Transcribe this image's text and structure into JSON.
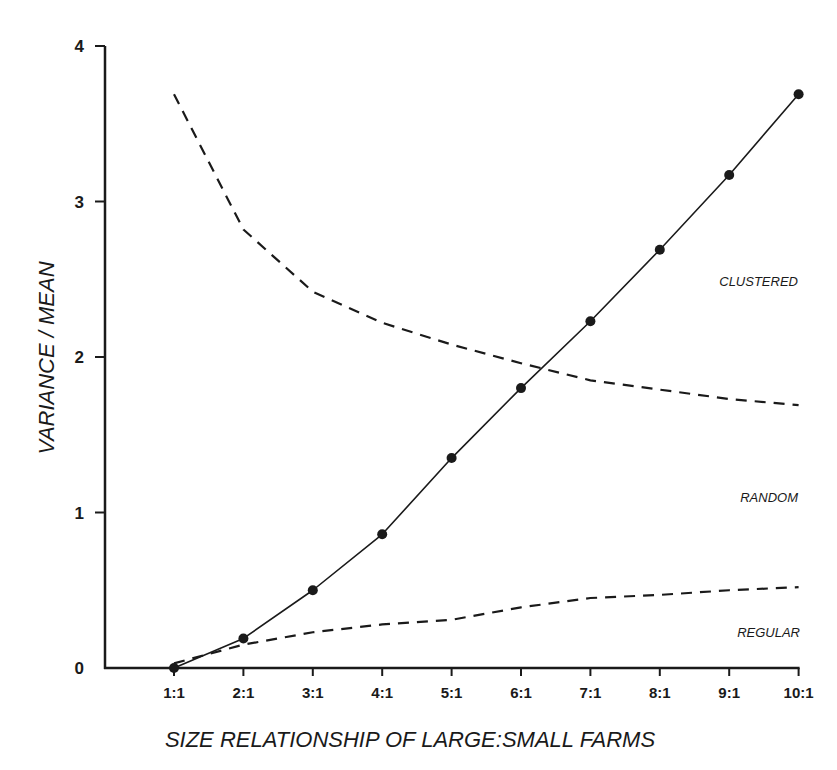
{
  "chart_data": {
    "type": "line",
    "title": "",
    "xlabel": "SIZE RELATIONSHIP OF LARGE:SMALL FARMS",
    "ylabel": "VARIANCE / MEAN",
    "categories": [
      "1:1",
      "2:1",
      "3:1",
      "4:1",
      "5:1",
      "6:1",
      "7:1",
      "8:1",
      "9:1",
      "10:1"
    ],
    "yticks": [
      "0",
      "1",
      "2",
      "3",
      "4"
    ],
    "ylim": [
      0,
      4
    ],
    "grid": false,
    "legend": "none",
    "series": [
      {
        "name": "Variance/Mean ratio",
        "style": "solid-with-markers",
        "values": [
          0.0,
          0.19,
          0.5,
          0.86,
          1.35,
          1.8,
          2.23,
          2.69,
          3.17,
          3.69
        ]
      },
      {
        "name": "Clustered/Random boundary",
        "style": "dashed",
        "values": [
          3.69,
          2.82,
          2.42,
          2.22,
          2.08,
          1.96,
          1.85,
          1.79,
          1.73,
          1.69
        ]
      },
      {
        "name": "Random/Regular boundary",
        "style": "dashed",
        "values": [
          0.03,
          0.15,
          0.23,
          0.28,
          0.31,
          0.39,
          0.45,
          0.47,
          0.5,
          0.52
        ]
      }
    ],
    "annotations": [
      {
        "text": "CLUSTERED",
        "region": "above upper dashed line"
      },
      {
        "text": "RANDOM",
        "region": "between dashed lines"
      },
      {
        "text": "REGULAR",
        "region": "below lower dashed line"
      }
    ]
  }
}
